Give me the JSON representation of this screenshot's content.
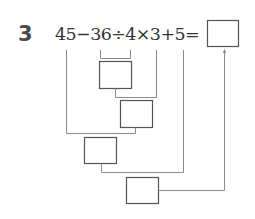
{
  "problem": {
    "number": "3",
    "equation": "45−36÷4×3+5=",
    "terms": [
      "45",
      "36",
      "4",
      "3",
      "5"
    ],
    "operators": [
      "−",
      "÷",
      "×",
      "+",
      "="
    ]
  },
  "diagram": {
    "steps": [
      {
        "id": "box-1",
        "operation": "36÷4",
        "value": ""
      },
      {
        "id": "box-2",
        "operation": "×3",
        "value": ""
      },
      {
        "id": "box-3",
        "operation": "45−",
        "value": ""
      },
      {
        "id": "box-4",
        "operation": "+5",
        "value": ""
      }
    ],
    "answer_box": {
      "value": ""
    },
    "colors": {
      "line": "#8a8a8a",
      "box": "#555555",
      "number": "#4a4a4a",
      "text": "#333333"
    }
  }
}
